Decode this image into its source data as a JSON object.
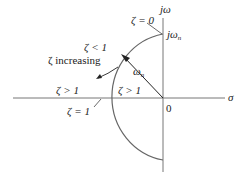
{
  "diagram": {
    "type": "s-plane damping ratio locus",
    "axes": {
      "horizontal_label": "σ",
      "vertical_label": "jω",
      "origin_label": "0"
    },
    "labels": {
      "zeta_zero": "ζ = 0",
      "j_omega_n": "jω",
      "j_omega_n_sub": "n",
      "zeta_less_1": "ζ < 1",
      "zeta_increasing": "ζ increasing",
      "zeta_greater_1_left": "ζ > 1",
      "zeta_greater_1_inner": "ζ > 1",
      "zeta_one": "ζ = 1",
      "omega_n": "ω",
      "omega_n_sub": "n"
    },
    "colors": {
      "curve": "#666666",
      "axis": "#777777",
      "text": "#222222"
    }
  }
}
